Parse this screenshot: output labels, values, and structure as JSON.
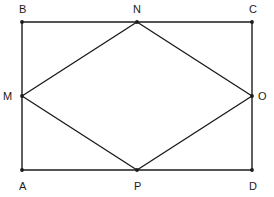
{
  "figure": {
    "canvas": {
      "width": 274,
      "height": 197
    },
    "background_color": "#ffffff",
    "stroke_color": "#1c1c1c",
    "stroke_width": 1.4,
    "point_color": "#1c1c1c",
    "point_radius": 1.9,
    "label_color": "#1c1c1c",
    "label_font_size": 11
  },
  "points": {
    "B": {
      "label": "B",
      "x": 22,
      "y": 22,
      "label_x": 19,
      "label_y": 4
    },
    "N": {
      "label": "N",
      "x": 137,
      "y": 22,
      "label_x": 133,
      "label_y": 4
    },
    "C": {
      "label": "C",
      "x": 252,
      "y": 22,
      "label_x": 249,
      "label_y": 4
    },
    "M": {
      "label": "M",
      "x": 22,
      "y": 96,
      "label_x": 3,
      "label_y": 91
    },
    "O": {
      "label": "O",
      "x": 252,
      "y": 96,
      "label_x": 258,
      "label_y": 91
    },
    "A": {
      "label": "A",
      "x": 22,
      "y": 170,
      "label_x": 19,
      "label_y": 181
    },
    "P": {
      "label": "P",
      "x": 137,
      "y": 170,
      "label_x": 134,
      "label_y": 181
    },
    "D": {
      "label": "D",
      "x": 252,
      "y": 170,
      "label_x": 249,
      "label_y": 181
    }
  },
  "shapes": {
    "rectangle": {
      "name": "rectangle-ABCD",
      "vertices": [
        "B",
        "C",
        "D",
        "A"
      ]
    },
    "rhombus": {
      "name": "rhombus-MNOP",
      "vertices": [
        "M",
        "N",
        "O",
        "P"
      ]
    }
  },
  "segments": [
    {
      "name": "segment-BC",
      "from": "B",
      "to": "C"
    },
    {
      "name": "segment-CD",
      "from": "C",
      "to": "D"
    },
    {
      "name": "segment-DA",
      "from": "D",
      "to": "A"
    },
    {
      "name": "segment-AB",
      "from": "A",
      "to": "B"
    },
    {
      "name": "segment-MN",
      "from": "M",
      "to": "N"
    },
    {
      "name": "segment-NO",
      "from": "N",
      "to": "O"
    },
    {
      "name": "segment-OP",
      "from": "O",
      "to": "P"
    },
    {
      "name": "segment-PM",
      "from": "P",
      "to": "M"
    }
  ]
}
